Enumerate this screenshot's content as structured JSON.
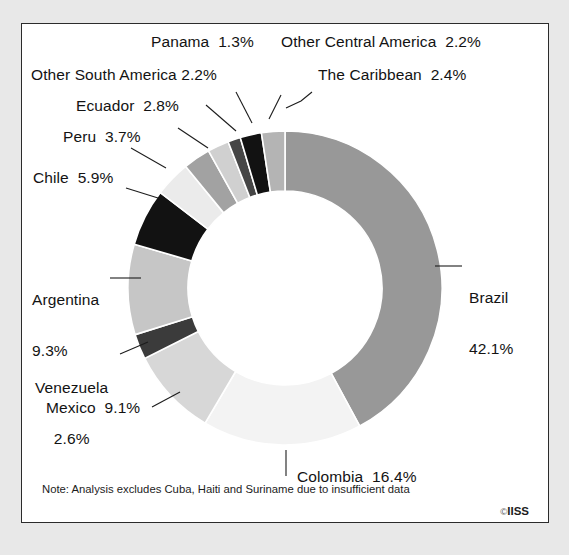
{
  "figure": {
    "note": "Note: Analysis excludes Cuba, Haiti and Suriname due to insufficient data",
    "copyright_mark": "©",
    "copyright_owner": "IISS",
    "background": "#ffffff",
    "border_color": "#2b2b2b"
  },
  "chart_data": {
    "type": "pie",
    "variant": "donut",
    "title": "",
    "subtitle": "",
    "xlabel": "",
    "ylabel": "",
    "legend_position": "none",
    "grid": false,
    "units": "percent",
    "total": 100.0,
    "start_angle_deg": 0,
    "direction": "clockwise",
    "inner_radius_px": 97,
    "outer_radius_px": 157,
    "center": {
      "x": 285,
      "y": 288
    },
    "categories": [
      "Brazil",
      "Colombia",
      "Mexico",
      "Venezuela",
      "Argentina",
      "Chile",
      "Peru",
      "Ecuador",
      "Other South America",
      "Panama",
      "Other Central America",
      "The Caribbean"
    ],
    "values": [
      42.1,
      16.4,
      9.1,
      2.6,
      9.3,
      5.9,
      3.7,
      2.8,
      2.2,
      1.3,
      2.2,
      2.4
    ],
    "colors": [
      "#989898",
      "#f3f3f3",
      "#d7d7d7",
      "#3b3b3b",
      "#c6c6c6",
      "#121212",
      "#ebebeb",
      "#a2a2a2",
      "#d0d0d0",
      "#464646",
      "#121212",
      "#b4b4b4"
    ],
    "slices": [
      {
        "name": "Brazil",
        "value": 42.1,
        "label": "Brazil",
        "value_label": "42.1%",
        "color": "#989898"
      },
      {
        "name": "Colombia",
        "value": 16.4,
        "label": "Colombia",
        "value_label": "16.4%",
        "color": "#f3f3f3"
      },
      {
        "name": "Mexico",
        "value": 9.1,
        "label": "Mexico",
        "value_label": "9.1%",
        "color": "#d7d7d7"
      },
      {
        "name": "Venezuela",
        "value": 2.6,
        "label": "Venezuela",
        "value_label": "2.6%",
        "color": "#3b3b3b"
      },
      {
        "name": "Argentina",
        "value": 9.3,
        "label": "Argentina",
        "value_label": "9.3%",
        "color": "#c6c6c6"
      },
      {
        "name": "Chile",
        "value": 5.9,
        "label": "Chile",
        "value_label": "5.9%",
        "color": "#121212"
      },
      {
        "name": "Peru",
        "value": 3.7,
        "label": "Peru",
        "value_label": "3.7%",
        "color": "#ebebeb"
      },
      {
        "name": "Ecuador",
        "value": 2.8,
        "label": "Ecuador",
        "value_label": "2.8%",
        "color": "#a2a2a2"
      },
      {
        "name": "Other South America",
        "value": 2.2,
        "label": "Other South America",
        "value_label": "2.2%",
        "color": "#d0d0d0"
      },
      {
        "name": "Panama",
        "value": 1.3,
        "label": "Panama",
        "value_label": "1.3%",
        "color": "#464646"
      },
      {
        "name": "Other Central America",
        "value": 2.2,
        "label": "Other Central America",
        "value_label": "2.2%",
        "color": "#121212"
      },
      {
        "name": "The Caribbean",
        "value": 2.4,
        "label": "The Caribbean",
        "value_label": "2.4%",
        "color": "#b4b4b4"
      }
    ]
  },
  "labels": {
    "panama": "Panama  1.3%",
    "other_central_america": "Other Central America  2.2%",
    "other_south_america": "Other South America 2.2%",
    "the_caribbean": "The Caribbean  2.4%",
    "ecuador": "Ecuador  2.8%",
    "peru": "Peru  3.7%",
    "chile": "Chile  5.9%",
    "argentina_name": "Argentina",
    "argentina_value": "9.3%",
    "venezuela_name": "Venezuela",
    "venezuela_value": "2.6%",
    "mexico": "Mexico  9.1%",
    "colombia": "Colombia  16.4%",
    "brazil_name": "Brazil",
    "brazil_value": "42.1%"
  }
}
